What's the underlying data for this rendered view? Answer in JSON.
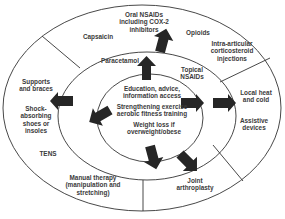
{
  "diagram": {
    "type": "concentric-ellipses-treatment-pyramid",
    "rings": {
      "core": {
        "items": [
          "Education, advice, information access",
          "Strengthening exercise aerobic fitness training",
          "Weight loss if overweight/obese"
        ]
      },
      "middle": {
        "items": [
          "Paracetamol",
          "Topical NSAIDs"
        ]
      },
      "outer": {
        "items": [
          "Oral NSAIDs including COX-2 inhibitors",
          "Capsaicin",
          "Opioids",
          "Intra-articular corticosteroid injections",
          "Supports and braces",
          "Shock-absorbing shoes or insoles",
          "TENS",
          "Manual therapy (manipulation and stretching)",
          "Local heat and cold",
          "Assistive devices",
          "Joint arthroplasty"
        ]
      }
    },
    "labels": {
      "core_1a": "Education, advice,",
      "core_1b": "information access",
      "core_2a": "Strengthening exercise",
      "core_2b": "aerobic fitness training",
      "core_3a": "Weight loss if",
      "core_3b": "overweight/obese",
      "paracetamol": "Paracetamol",
      "topical_a": "Topical",
      "topical_b": "NSAIDs",
      "oral_a": "Oral NSAIDs",
      "oral_b": "including COX-2",
      "oral_c": "inhibitors",
      "capsaicin": "Capsaicin",
      "opioids": "Opioids",
      "intra_a": "Intra-articular",
      "intra_b": "corticosteroid",
      "intra_c": "injections",
      "supports_a": "Supports",
      "supports_b": "and braces",
      "shock_a": "Shock-",
      "shock_b": "absorbing",
      "shock_c": "shoes or",
      "shock_d": "insoles",
      "tens": "TENS",
      "manual_a": "Manual therapy",
      "manual_b": "(manipulation and",
      "manual_c": "stretching)",
      "heat_a": "Local heat",
      "heat_b": "and cold",
      "assistive_a": "Assistive",
      "assistive_b": "devices",
      "joint_a": "Joint",
      "joint_b": "arthroplasty"
    },
    "colors": {
      "line": "#333333",
      "arrow": "#262626",
      "text": "#3a3a3a",
      "background": "#ffffff"
    }
  }
}
